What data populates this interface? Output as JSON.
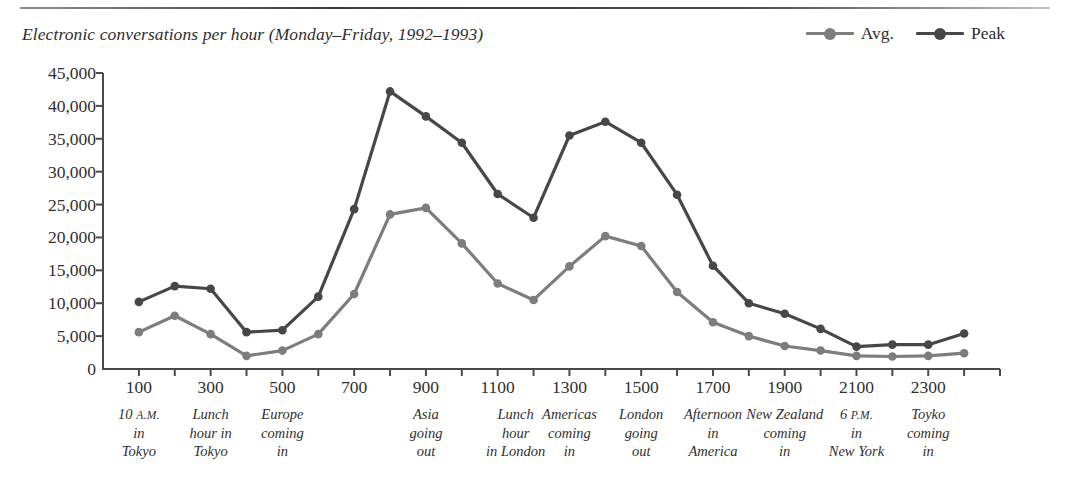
{
  "figure": {
    "title": "Electronic conversations per hour (Monday–Friday, 1992–1993)"
  },
  "legend": {
    "position": "top-right",
    "items": [
      {
        "label": "Avg.",
        "color": "#7d7d7d",
        "name": "legend-avg"
      },
      {
        "label": "Peak",
        "color": "#474747",
        "name": "legend-peak"
      }
    ]
  },
  "colors": {
    "avg": "#7d7d7d",
    "peak": "#474747",
    "axis": "#4a4a4a",
    "text": "#2f2f2f"
  },
  "axes": {
    "y_ticks": [
      "0",
      "5,000",
      "10,000",
      "15,000",
      "20,000",
      "25,000",
      "30,000",
      "35,000",
      "40,000",
      "45,000"
    ],
    "x_ticks": [
      "100",
      "300",
      "500",
      "700",
      "900",
      "1100",
      "1300",
      "1500",
      "1700",
      "1900",
      "2100",
      "2300"
    ]
  },
  "annotations": [
    {
      "at": 100,
      "lines": [
        "10 A.M.",
        "in",
        "Tokyo"
      ],
      "smallcaps": "A.M."
    },
    {
      "at": 300,
      "lines": [
        "Lunch",
        "hour in",
        "Tokyo"
      ],
      "smallcaps": ""
    },
    {
      "at": 500,
      "lines": [
        "Europe",
        "coming",
        "in"
      ],
      "smallcaps": ""
    },
    {
      "at": 900,
      "lines": [
        "Asia",
        "going",
        "out"
      ],
      "smallcaps": ""
    },
    {
      "at": 1150,
      "lines": [
        "Lunch",
        "hour",
        "in London"
      ],
      "smallcaps": ""
    },
    {
      "at": 1300,
      "lines": [
        "Americas",
        "coming",
        "in"
      ],
      "smallcaps": ""
    },
    {
      "at": 1500,
      "lines": [
        "London",
        "going",
        "out"
      ],
      "smallcaps": ""
    },
    {
      "at": 1700,
      "lines": [
        "Afternoon",
        "in",
        "America"
      ],
      "smallcaps": ""
    },
    {
      "at": 1900,
      "lines": [
        "New Zealand",
        "coming",
        "in"
      ],
      "smallcaps": ""
    },
    {
      "at": 2100,
      "lines": [
        "6 P.M.",
        "in",
        "New York"
      ],
      "smallcaps": "P.M."
    },
    {
      "at": 2300,
      "lines": [
        "Toyko",
        "coming",
        "in"
      ],
      "smallcaps": ""
    }
  ],
  "chart_data": {
    "type": "line",
    "title": "Electronic conversations per hour (Monday–Friday, 1992–1993)",
    "xlabel": "",
    "ylabel": "",
    "xlim": [
      0,
      2500
    ],
    "ylim": [
      0,
      45000
    ],
    "ytick_step": 5000,
    "xtick_step": 100,
    "xtick_label_step": 200,
    "grid": false,
    "legend_position": "top-right",
    "x": [
      100,
      200,
      300,
      400,
      500,
      600,
      700,
      800,
      900,
      1000,
      1100,
      1200,
      1300,
      1400,
      1500,
      1600,
      1700,
      1800,
      1900,
      2000,
      2100,
      2200,
      2300,
      2400
    ],
    "series": [
      {
        "name": "Avg.",
        "color": "#7d7d7d",
        "values": [
          5600,
          8100,
          5300,
          2000,
          2800,
          5300,
          11400,
          23500,
          24500,
          19100,
          13000,
          10500,
          15600,
          20200,
          18700,
          11700,
          7100,
          5000,
          3500,
          2800,
          2000,
          1900,
          2000,
          2400
        ]
      },
      {
        "name": "Peak",
        "color": "#474747",
        "values": [
          10200,
          12600,
          12200,
          5600,
          5900,
          11000,
          24300,
          42200,
          38400,
          34400,
          26600,
          23000,
          35500,
          37600,
          34400,
          26500,
          15700,
          10000,
          8400,
          6100,
          3400,
          3700,
          3700,
          5400
        ]
      }
    ]
  }
}
